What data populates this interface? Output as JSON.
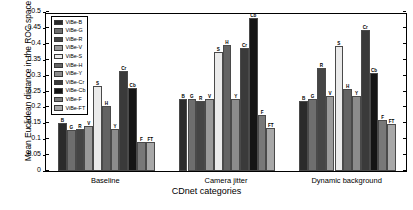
{
  "chart_data": {
    "type": "bar",
    "title": "",
    "xlabel": "CDnet categories",
    "ylabel": "Mean Euclidean distance in the ROC space",
    "ylim": [
      0,
      0.5
    ],
    "ytick_labels": [
      "0",
      "0.05",
      "0.1",
      "0.15",
      "0.2",
      "0.25",
      "0.3",
      "0.35",
      "0.4",
      "0.45",
      "0.5"
    ],
    "ytick_values": [
      0,
      0.05,
      0.1,
      0.15,
      0.2,
      0.25,
      0.3,
      0.35,
      0.4,
      0.45,
      0.5
    ],
    "grid": false,
    "legend_position": "upper left",
    "categories": [
      "Baseline",
      "Camera jitter",
      "Dynamic background"
    ],
    "series": [
      {
        "name": "ViBe-B",
        "short": "B",
        "color": "#2b2b2b",
        "values": [
          0.15,
          0.226,
          0.221
        ]
      },
      {
        "name": "ViBe-G",
        "short": "G",
        "color": "#6e6e6e",
        "values": [
          0.13,
          0.227,
          0.226
        ]
      },
      {
        "name": "ViBe-R",
        "short": "R",
        "color": "#454545",
        "values": [
          0.132,
          0.221,
          0.323
        ]
      },
      {
        "name": "ViBe-V",
        "short": "V",
        "color": "#9a9a9a",
        "values": [
          0.14,
          0.225,
          0.237
        ]
      },
      {
        "name": "ViBe-S",
        "short": "S",
        "color": "#ebebeb",
        "values": [
          0.267,
          0.374,
          0.394
        ]
      },
      {
        "name": "ViBe-H",
        "short": "H",
        "color": "#636363",
        "values": [
          0.205,
          0.397,
          0.258
        ]
      },
      {
        "name": "ViBe-Y",
        "short": "Y",
        "color": "#8c8c8c",
        "values": [
          0.131,
          0.226,
          0.236
        ]
      },
      {
        "name": "ViBe-Cr",
        "short": "Cr",
        "color": "#3a3a3a",
        "values": [
          0.313,
          0.388,
          0.443
        ]
      },
      {
        "name": "ViBe-Cb",
        "short": "Cb",
        "color": "#151515",
        "values": [
          0.26,
          0.481,
          0.308
        ]
      },
      {
        "name": "ViBe-F",
        "short": "F",
        "color": "#787878",
        "values": [
          0.09,
          0.175,
          0.16
        ]
      },
      {
        "name": "ViBe-FT",
        "short": "FT",
        "color": "#a8a8a8",
        "values": [
          0.09,
          0.136,
          0.148
        ]
      }
    ]
  }
}
